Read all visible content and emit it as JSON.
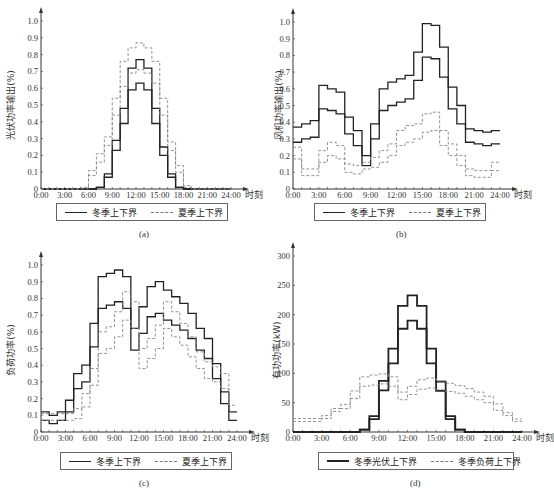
{
  "chart_data": [
    {
      "id": "a",
      "type": "line",
      "step": true,
      "caption": "(a)",
      "title": "",
      "xlabel": "时刻",
      "ylabel": "光伏功率输出(%)",
      "x_ticks": [
        "0:00",
        "3:00",
        "6:00",
        "9:00",
        "12:00",
        "15:00",
        "18:00",
        "21:00",
        "24:00"
      ],
      "y_ticks": [
        "0",
        "0.1",
        "0.2",
        "0.3",
        "0.4",
        "0.5",
        "0.6",
        "0.7",
        "0.8",
        "0.9",
        "1.0"
      ],
      "ylim": [
        0,
        1.0
      ],
      "xlim": [
        0,
        24
      ],
      "grid": false,
      "legend_position": "bottom",
      "series": [
        {
          "name": "冬季上下界 (upper)",
          "legend": "冬季上下界",
          "style": "solid",
          "values": [
            0,
            0,
            0,
            0,
            0,
            0,
            0,
            0.01,
            0.09,
            0.29,
            0.48,
            0.72,
            0.77,
            0.72,
            0.48,
            0.25,
            0.09,
            0.01,
            0,
            0,
            0,
            0,
            0,
            0
          ]
        },
        {
          "name": "冬季上下界 (lower)",
          "style": "solid",
          "values": [
            0,
            0,
            0,
            0,
            0,
            0,
            0,
            0.01,
            0.07,
            0.23,
            0.39,
            0.59,
            0.63,
            0.59,
            0.39,
            0.2,
            0.07,
            0.01,
            0,
            0,
            0,
            0,
            0,
            0
          ]
        },
        {
          "name": "夏季上下界 (upper)",
          "legend": "夏季上下界",
          "style": "dashed",
          "values": [
            0,
            0,
            0,
            0,
            0,
            0,
            0.11,
            0.21,
            0.31,
            0.54,
            0.76,
            0.84,
            0.87,
            0.84,
            0.76,
            0.54,
            0.28,
            0.14,
            0.02,
            0,
            0,
            0,
            0,
            0
          ]
        },
        {
          "name": "夏季上下界 (lower)",
          "style": "dashed",
          "values": [
            0,
            0,
            0,
            0,
            0,
            0.01,
            0.08,
            0.16,
            0.26,
            0.44,
            0.61,
            0.69,
            0.71,
            0.69,
            0.63,
            0.44,
            0.23,
            0.1,
            0.01,
            0,
            0,
            0,
            0,
            0
          ]
        }
      ]
    },
    {
      "id": "b",
      "type": "line",
      "step": true,
      "caption": "(b)",
      "title": "",
      "xlabel": "时刻",
      "ylabel": "风机功率输出(%)",
      "x_ticks": [
        "0:00",
        "3:00",
        "6:00",
        "9:00",
        "12:00",
        "15:00",
        "18:00",
        "21:00",
        "24:00"
      ],
      "y_ticks": [
        "0",
        "0.1",
        "0.2",
        "0.3",
        "0.4",
        "0.5",
        "0.6",
        "0.7",
        "0.8",
        "0.9",
        "1.0"
      ],
      "ylim": [
        0,
        1.0
      ],
      "xlim": [
        0,
        24
      ],
      "grid": false,
      "legend_position": "bottom",
      "series": [
        {
          "name": "冬季上下界 (upper)",
          "legend": "冬季上下界",
          "style": "solid",
          "values": [
            0.37,
            0.39,
            0.41,
            0.62,
            0.6,
            0.58,
            0.43,
            0.35,
            0.2,
            0.39,
            0.6,
            0.64,
            0.66,
            0.68,
            0.82,
            0.99,
            0.98,
            0.85,
            0.61,
            0.5,
            0.36,
            0.35,
            0.34,
            0.35
          ]
        },
        {
          "name": "冬季上下界 (lower)",
          "style": "solid",
          "values": [
            0.28,
            0.3,
            0.31,
            0.48,
            0.47,
            0.45,
            0.33,
            0.26,
            0.14,
            0.3,
            0.47,
            0.5,
            0.52,
            0.54,
            0.65,
            0.79,
            0.78,
            0.67,
            0.48,
            0.39,
            0.28,
            0.27,
            0.26,
            0.27
          ]
        },
        {
          "name": "夏季上下界 (upper)",
          "legend": "夏季上下界",
          "style": "dashed",
          "values": [
            0.25,
            0.12,
            0.12,
            0.23,
            0.28,
            0.26,
            0.15,
            0.14,
            0.16,
            0.19,
            0.23,
            0.27,
            0.35,
            0.38,
            0.39,
            0.45,
            0.46,
            0.35,
            0.27,
            0.2,
            0.12,
            0.11,
            0.11,
            0.16
          ]
        },
        {
          "name": "夏季上下界 (lower)",
          "style": "dashed",
          "values": [
            0.18,
            0.08,
            0.08,
            0.16,
            0.2,
            0.18,
            0.1,
            0.09,
            0.12,
            0.13,
            0.16,
            0.2,
            0.26,
            0.28,
            0.3,
            0.34,
            0.35,
            0.26,
            0.2,
            0.14,
            0.08,
            0.07,
            0.07,
            0.11
          ]
        }
      ]
    },
    {
      "id": "c",
      "type": "line",
      "step": true,
      "caption": "(c)",
      "title": "",
      "xlabel": "时刻",
      "ylabel": "负荷功率(%)",
      "x_ticks": [
        "0:00",
        "3:00",
        "6:00",
        "9:00",
        "12:00",
        "15:00",
        "18:00",
        "21:00",
        "24:00"
      ],
      "y_ticks": [
        "0",
        "0.1",
        "0.2",
        "0.3",
        "0.4",
        "0.5",
        "0.6",
        "0.7",
        "0.8",
        "0.9",
        "1.0"
      ],
      "ylim": [
        0,
        1.0
      ],
      "xlim": [
        0,
        24
      ],
      "grid": false,
      "legend_position": "bottom",
      "series": [
        {
          "name": "冬季上下界 (upper)",
          "legend": "冬季上下界",
          "style": "solid",
          "values": [
            0.12,
            0.1,
            0.12,
            0.19,
            0.35,
            0.4,
            0.65,
            0.93,
            0.95,
            0.97,
            0.93,
            0.62,
            0.75,
            0.87,
            0.9,
            0.85,
            0.81,
            0.77,
            0.71,
            0.62,
            0.56,
            0.41,
            0.24,
            0.12
          ]
        },
        {
          "name": "冬季上下界 (lower)",
          "style": "solid",
          "values": [
            0.07,
            0.05,
            0.07,
            0.12,
            0.26,
            0.3,
            0.51,
            0.74,
            0.76,
            0.78,
            0.74,
            0.49,
            0.59,
            0.69,
            0.71,
            0.67,
            0.64,
            0.61,
            0.56,
            0.49,
            0.44,
            0.32,
            0.17,
            0.07
          ]
        },
        {
          "name": "夏季上下界 (upper)",
          "legend": "夏季上下界",
          "style": "dashed",
          "values": [
            0.11,
            0.11,
            0.11,
            0.11,
            0.14,
            0.23,
            0.38,
            0.6,
            0.63,
            0.72,
            0.84,
            0.78,
            0.5,
            0.56,
            0.64,
            0.78,
            0.72,
            0.65,
            0.57,
            0.48,
            0.42,
            0.39,
            0.35,
            0.16
          ]
        },
        {
          "name": "夏季上下界 (lower)",
          "style": "dashed",
          "values": [
            0.07,
            0.07,
            0.07,
            0.07,
            0.08,
            0.15,
            0.28,
            0.47,
            0.5,
            0.57,
            0.67,
            0.62,
            0.38,
            0.44,
            0.5,
            0.62,
            0.57,
            0.52,
            0.45,
            0.38,
            0.32,
            0.3,
            0.26,
            0.12
          ]
        }
      ]
    },
    {
      "id": "d",
      "type": "line",
      "step": true,
      "caption": "(d)",
      "title": "",
      "xlabel": "时刻",
      "ylabel": "有功功率(kW)",
      "x_ticks": [
        "0:00",
        "3:00",
        "6:00",
        "9:00",
        "12:00",
        "15:00",
        "18:00",
        "21:00",
        "24:00"
      ],
      "y_ticks": [
        "0",
        "50",
        "100",
        "150",
        "200",
        "250",
        "300"
      ],
      "ylim": [
        0,
        300
      ],
      "xlim": [
        0,
        24
      ],
      "grid": false,
      "legend_position": "bottom",
      "series": [
        {
          "name": "冬季光伏上下界 (upper)",
          "legend": "冬季光伏上下界",
          "style": "solid-bold",
          "values": [
            0,
            0,
            0,
            0,
            0,
            0,
            0,
            4,
            27,
            87,
            142,
            215,
            233,
            215,
            142,
            86,
            27,
            4,
            0,
            0,
            0,
            0,
            0,
            0
          ]
        },
        {
          "name": "冬季光伏上下界 (lower)",
          "style": "solid-bold",
          "values": [
            0,
            0,
            0,
            0,
            0,
            0,
            0,
            4,
            22,
            71,
            117,
            176,
            190,
            176,
            117,
            70,
            22,
            4,
            0,
            0,
            0,
            0,
            0,
            0
          ]
        },
        {
          "name": "冬季负荷上下界 (upper)",
          "legend": "冬季负荷上下界",
          "style": "dashed",
          "values": [
            23,
            23,
            23,
            28,
            40,
            47,
            70,
            94,
            97,
            99,
            94,
            68,
            78,
            89,
            92,
            87,
            83,
            79,
            74,
            68,
            61,
            48,
            33,
            22
          ]
        },
        {
          "name": "冬季负荷上下界 (lower)",
          "style": "dashed",
          "values": [
            18,
            18,
            18,
            23,
            35,
            40,
            57,
            78,
            80,
            82,
            78,
            55,
            64,
            73,
            75,
            72,
            69,
            66,
            61,
            55,
            50,
            37,
            28,
            18
          ]
        }
      ]
    }
  ],
  "legends": {
    "a": {
      "items": [
        "冬季上下界",
        "夏季上下界"
      ]
    },
    "b": {
      "items": [
        "冬季上下界",
        "夏季上下界"
      ]
    },
    "c": {
      "items": [
        "冬季上下界",
        "夏季上下界"
      ]
    },
    "d": {
      "items": [
        "冬季光伏上下界",
        "冬季负荷上下界"
      ]
    }
  },
  "captions": {
    "a": "(a)",
    "b": "(b)",
    "c": "(c)",
    "d": "(d)"
  },
  "colors": {
    "solid": "#222222",
    "dashed": "#888888",
    "axis": "#333333"
  }
}
